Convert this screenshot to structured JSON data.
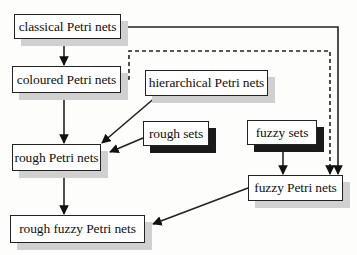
{
  "diagram": {
    "nodes": [
      {
        "id": "classical",
        "label": "classical Petri nets"
      },
      {
        "id": "coloured",
        "label": "coloured Petri nets"
      },
      {
        "id": "hierarchical",
        "label": "hierarchical Petri nets"
      },
      {
        "id": "rough_sets",
        "label": "rough sets"
      },
      {
        "id": "fuzzy_sets",
        "label": "fuzzy sets"
      },
      {
        "id": "rough_petri",
        "label": "rough Petri nets"
      },
      {
        "id": "fuzzy_petri",
        "label": "fuzzy Petri nets"
      },
      {
        "id": "rough_fuzzy_petri",
        "label": "rough fuzzy Petri nets"
      }
    ],
    "edges": [
      {
        "from": "classical",
        "to": "coloured",
        "style": "solid"
      },
      {
        "from": "classical",
        "to": "fuzzy_petri",
        "style": "solid"
      },
      {
        "from": "coloured",
        "to": "fuzzy_petri",
        "style": "dashed"
      },
      {
        "from": "coloured",
        "to": "rough_petri",
        "style": "solid"
      },
      {
        "from": "hierarchical",
        "to": "rough_petri",
        "style": "solid"
      },
      {
        "from": "rough_sets",
        "to": "rough_petri",
        "style": "solid"
      },
      {
        "from": "fuzzy_sets",
        "to": "fuzzy_petri",
        "style": "solid"
      },
      {
        "from": "rough_petri",
        "to": "rough_fuzzy_petri",
        "style": "solid"
      },
      {
        "from": "fuzzy_petri",
        "to": "rough_fuzzy_petri",
        "style": "solid"
      }
    ]
  }
}
